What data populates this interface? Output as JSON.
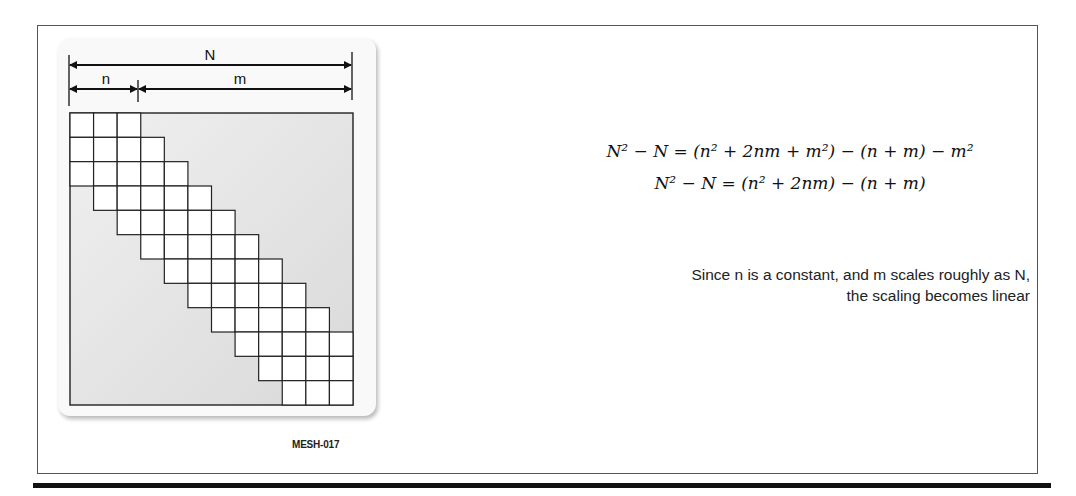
{
  "figure": {
    "id_label": "MESH-017",
    "dimensions": {
      "total_label": "N",
      "left_label": "n",
      "right_label": "m"
    },
    "matrix": {
      "size": 12,
      "half_bandwidth": 2,
      "block_cols_n": 3
    },
    "colors": {
      "band_fill": "#ffffff",
      "off_band_fill": "#e6e6e6",
      "grid_line": "#222222"
    }
  },
  "equations": [
    {
      "lhs": "N² − N",
      "rhs": "(n² + 2nm + m²) − (n + m) − m²"
    },
    {
      "lhs": "N² − N",
      "rhs": "(n² + 2nm) − (n + m)"
    }
  ],
  "note": {
    "line1": "Since n is a constant, and m scales roughly as N,",
    "line2": "the scaling becomes linear"
  }
}
